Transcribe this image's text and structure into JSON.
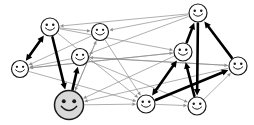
{
  "figure": {
    "background_color": "#ffffff",
    "width": 254,
    "height": 125
  },
  "style": {
    "thin_edge_color": "#8d8d8d",
    "bold_edge_color": "#000000",
    "node_stroke_color": "#1a1a1a",
    "node_fill_color": "#ffffff",
    "highlight_node_fill_color": "#d9d9d9",
    "thin_edge_width": 0.7,
    "bold_edge_width": 2.6
  },
  "graph_data": {
    "type": "node-link-diagram",
    "directed": true,
    "node_glyph": "smiley-face",
    "node_count": 10,
    "nodes": [
      {
        "id": "n0",
        "label": "",
        "x": 50,
        "y": 27,
        "r": 9,
        "fill": "#ffffff",
        "size": "small"
      },
      {
        "id": "n1",
        "label": "",
        "x": 100,
        "y": 32,
        "r": 8.5,
        "fill": "#ffffff",
        "size": "small"
      },
      {
        "id": "n2",
        "label": "",
        "x": 198,
        "y": 13,
        "r": 9,
        "fill": "#ffffff",
        "size": "small"
      },
      {
        "id": "n3",
        "label": "",
        "x": 20,
        "y": 69,
        "r": 8.5,
        "fill": "#ffffff",
        "size": "small"
      },
      {
        "id": "n4",
        "label": "",
        "x": 80,
        "y": 57,
        "r": 8.5,
        "fill": "#ffffff",
        "size": "small"
      },
      {
        "id": "n5",
        "label": "",
        "x": 183,
        "y": 52,
        "r": 9,
        "fill": "#ffffff",
        "size": "small"
      },
      {
        "id": "n6",
        "label": "",
        "x": 238,
        "y": 66,
        "r": 9,
        "fill": "#ffffff",
        "size": "small"
      },
      {
        "id": "n7",
        "label": "",
        "x": 69,
        "y": 105,
        "r": 14.5,
        "fill": "#d9d9d9",
        "size": "large"
      },
      {
        "id": "n8",
        "label": "",
        "x": 146,
        "y": 104,
        "r": 9,
        "fill": "#ffffff",
        "size": "small"
      },
      {
        "id": "n9",
        "label": "",
        "x": 197,
        "y": 106,
        "r": 9,
        "fill": "#ffffff",
        "size": "small"
      }
    ],
    "bold_edges": [
      {
        "from": "n3",
        "to": "n0",
        "arrow": "both"
      },
      {
        "from": "n0",
        "to": "n7",
        "arrow": "to"
      },
      {
        "from": "n7",
        "to": "n4",
        "arrow": "to"
      },
      {
        "from": "n2",
        "to": "n9",
        "arrow": "to"
      },
      {
        "from": "n5",
        "to": "n2",
        "arrow": "to"
      },
      {
        "from": "n5",
        "to": "n8",
        "arrow": "both"
      },
      {
        "from": "n9",
        "to": "n5",
        "arrow": "to"
      },
      {
        "from": "n8",
        "to": "n6",
        "arrow": "to"
      },
      {
        "from": "n6",
        "to": "n2",
        "arrow": "to"
      }
    ],
    "thin_edges": [
      {
        "from": "n2",
        "to": "n0",
        "arrow": "to"
      },
      {
        "from": "n2",
        "to": "n1",
        "arrow": "to"
      },
      {
        "from": "n0",
        "to": "n1",
        "arrow": "to"
      },
      {
        "from": "n0",
        "to": "n5",
        "arrow": "to"
      },
      {
        "from": "n1",
        "to": "n3",
        "arrow": "to"
      },
      {
        "from": "n1",
        "to": "n7",
        "arrow": "to"
      },
      {
        "from": "n1",
        "to": "n8",
        "arrow": "to"
      },
      {
        "from": "n3",
        "to": "n5",
        "arrow": "to"
      },
      {
        "from": "n3",
        "to": "n8",
        "arrow": "to"
      },
      {
        "from": "n4",
        "to": "n3",
        "arrow": "to"
      },
      {
        "from": "n4",
        "to": "n6",
        "arrow": "to"
      },
      {
        "from": "n4",
        "to": "n9",
        "arrow": "to"
      },
      {
        "from": "n5",
        "to": "n3",
        "arrow": "to"
      },
      {
        "from": "n5",
        "to": "n7",
        "arrow": "to"
      },
      {
        "from": "n6",
        "to": "n7",
        "arrow": "to"
      },
      {
        "from": "n6",
        "to": "n4",
        "arrow": "to"
      },
      {
        "from": "n7",
        "to": "n8",
        "arrow": "to"
      },
      {
        "from": "n7",
        "to": "n1",
        "arrow": "to"
      },
      {
        "from": "n8",
        "to": "n9",
        "arrow": "to"
      },
      {
        "from": "n9",
        "to": "n6",
        "arrow": "to"
      },
      {
        "from": "n2",
        "to": "n4",
        "arrow": "to"
      },
      {
        "from": "n0",
        "to": "n8",
        "arrow": "to"
      }
    ]
  }
}
